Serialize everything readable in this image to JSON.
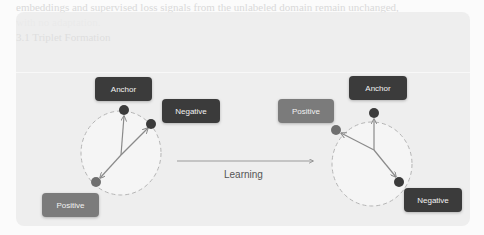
{
  "background_text": {
    "lines": [
      "embeddings and supervised loss signals from the unlabeled domain remain unchanged,",
      "with no adaptation.",
      "3.1 Triplet Formation",
      "1. Anchor",
      "of the three points the model learns to pull together anchors and positives while pushing negatives",
      "away from the anchor in the embedding space, so that similar examples cluster and dissimilar ones",
      "separate. Given the triplet configuration, the loss encourages the anchor-positive distance",
      "to be smaller than anchor-negative distance by a margin.",
      "3.2 Batch-Hard Mining Strategy"
    ]
  },
  "diagram": {
    "center_label": "Learning",
    "before": {
      "anchor_label": "Anchor",
      "negative_label": "Negative",
      "positive_label": "Positive"
    },
    "after": {
      "anchor_label": "Anchor",
      "positive_label": "Positive",
      "negative_label": "Negative"
    },
    "colors": {
      "anchor": "#3b3b3b",
      "negative": "#3b3b3b",
      "positive": "#7b7b7b",
      "arrow": "#8a8a8a",
      "circle_stroke": "#b5b5b5"
    }
  }
}
